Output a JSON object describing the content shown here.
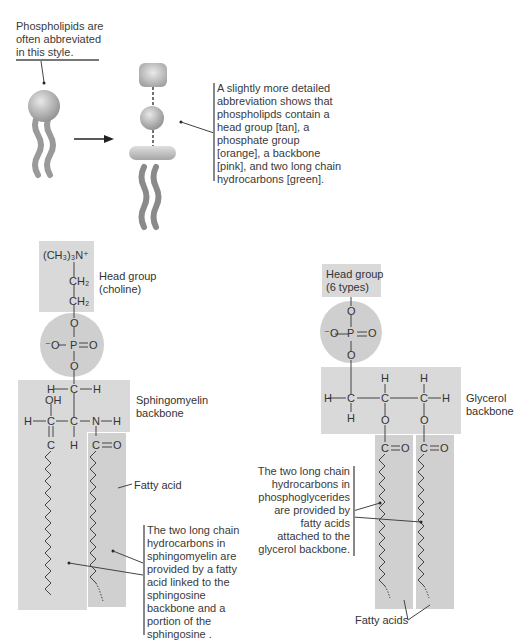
{
  "top": {
    "intro_caption": [
      "Phospholipids are",
      "often abbreviated",
      "in this style."
    ],
    "detail_caption": [
      "A slightly more detailed",
      "abbreviation shows that",
      "phospholipds contain a",
      "head group [tan], a",
      "phosphate group",
      "[orange], a backbone",
      "[pink], and two long chain",
      "hydrocarbons [green]."
    ]
  },
  "sphingomyelin": {
    "head_label": [
      "Head group",
      "(choline)"
    ],
    "backbone_label": [
      "Sphingomyelin",
      "backbone"
    ],
    "fatty_acid_label": "Fatty acid",
    "caption": [
      "The two long chain",
      "hydrocarbons in",
      "sphingomyelin are",
      "provided by a fatty",
      "acid linked to the",
      "sphingosine",
      "backbone and a",
      "portion of the",
      "sphingosine ."
    ],
    "atoms": {
      "choline_n": "(CH₃)₃N⁺",
      "ch2_top": "CH₂",
      "ch2_bottom": "CH₂",
      "o_upper": "O",
      "o_minus": "⁻O",
      "p": "P",
      "o_double": "O",
      "o_lower": "O",
      "h_left1": "H",
      "c1": "C",
      "h_right1": "H",
      "oh": "OH",
      "h_left2": "H",
      "c2": "C",
      "c3": "C",
      "n": "N",
      "h_n": "H",
      "c_alkene": "C",
      "h_below": "H",
      "c_carbonyl": "C",
      "o_carbonyl": "O"
    }
  },
  "phosphoglyceride": {
    "head_label": [
      "Head group",
      "(6 types)"
    ],
    "backbone_label": [
      "Glycerol",
      "backbone"
    ],
    "fatty_acids_label": "Fatty acids",
    "caption": [
      "The two long chain",
      "hydrocarbons in",
      "phosphoglycerides",
      "are provided by",
      "fatty acids",
      "attached to the",
      "glycerol backbone."
    ],
    "atoms": {
      "o_upper": "O",
      "o_minus": "⁻O",
      "p": "P",
      "o_double": "O",
      "o_lower": "O",
      "h_top2": "H",
      "h_top3": "H",
      "h_left": "H",
      "c1": "C",
      "c2": "C",
      "c3": "C",
      "h_right": "H",
      "h_bottom1": "H",
      "o_ester1": "O",
      "o_ester2": "O",
      "c_carb1": "C",
      "o_carb1": "O",
      "c_carb2": "C",
      "o_carb2": "O"
    }
  },
  "colors": {
    "box_gray": "#d9d9d9",
    "circle_gray": "#cfcfcf",
    "line": "#555555",
    "caption_bar": "#888888"
  }
}
